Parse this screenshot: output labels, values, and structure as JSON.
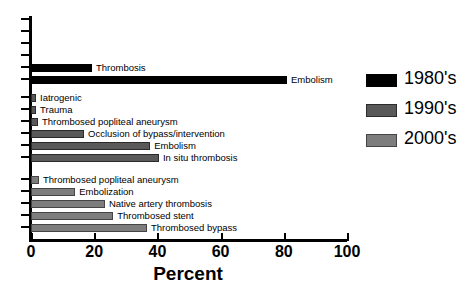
{
  "chart_data": {
    "type": "bar",
    "title": "",
    "xlabel": "Percent",
    "ylabel": "",
    "xlim": [
      0,
      100
    ],
    "xticks": [
      0,
      20,
      40,
      60,
      80,
      100
    ],
    "orientation": "horizontal",
    "grid": false,
    "legend_position": "right",
    "series": [
      {
        "name": "1980's",
        "color": "#000000",
        "categories": [
          "Thrombosis",
          "Embolism"
        ],
        "values": [
          19.3,
          81.0
        ]
      },
      {
        "name": "1990's",
        "color": "#595959",
        "categories": [
          "Iatrogenic",
          "Trauma",
          "Thrombosed popliteal aneurysm",
          "Occlusion of bypass/intervention",
          "Embolism",
          "In situ thrombosis"
        ],
        "values": [
          1.6,
          1.6,
          2.2,
          16.8,
          37.7,
          40.5
        ]
      },
      {
        "name": "2000's",
        "color": "#7d7d7d",
        "categories": [
          "Thrombosed popliteal aneurysm",
          "Embolization",
          "Native artery thrombosis",
          "Thrombosed stent",
          "Thrombosed bypass"
        ],
        "values": [
          2.5,
          14.0,
          23.4,
          26.0,
          36.7
        ]
      }
    ]
  },
  "axis": {
    "x_title": "Percent",
    "x_tick_labels": [
      "0",
      "20",
      "40",
      "60",
      "80",
      "100"
    ]
  },
  "bars": [
    {
      "label": "Thrombosis",
      "value": 19.3,
      "series": "1980's",
      "top": 64,
      "style": "c1980"
    },
    {
      "label": "Embolism",
      "value": 81.0,
      "series": "1980's",
      "top": 76,
      "style": "c1980"
    },
    {
      "label": "Iatrogenic",
      "value": 1.6,
      "series": "1990's",
      "top": 94,
      "style": "c1990"
    },
    {
      "label": "Trauma",
      "value": 1.6,
      "series": "1990's",
      "top": 106,
      "style": "c1990"
    },
    {
      "label": "Thrombosed popliteal aneurysm",
      "value": 2.2,
      "series": "1990's",
      "top": 118,
      "style": "c1990"
    },
    {
      "label": "Occlusion of bypass/intervention",
      "value": 16.8,
      "series": "1990's",
      "top": 130,
      "style": "c1990"
    },
    {
      "label": "Embolism",
      "value": 37.7,
      "series": "1990's",
      "top": 142,
      "style": "c1990"
    },
    {
      "label": "In situ thrombosis",
      "value": 40.5,
      "series": "1990's",
      "top": 154,
      "style": "c1990"
    },
    {
      "label": "Thrombosed popliteal aneurysm",
      "value": 2.5,
      "series": "2000's",
      "top": 176,
      "style": "c2000"
    },
    {
      "label": "Embolization",
      "value": 14.0,
      "series": "2000's",
      "top": 188,
      "style": "c2000"
    },
    {
      "label": "Native artery thrombosis",
      "value": 23.4,
      "series": "2000's",
      "top": 200,
      "style": "c2000"
    },
    {
      "label": "Thrombosed stent",
      "value": 26.0,
      "series": "2000's",
      "top": 212,
      "style": "c2000"
    },
    {
      "label": "Thrombosed bypass",
      "value": 36.7,
      "series": "2000's",
      "top": 224,
      "style": "c2000"
    }
  ],
  "y_tick_positions": [
    18,
    30,
    42,
    54,
    66,
    78,
    96,
    108,
    120,
    132,
    144,
    156,
    178,
    190,
    202,
    214,
    226
  ],
  "legend": {
    "items": [
      {
        "label": "1980's",
        "style": "c1980",
        "color": "#000000"
      },
      {
        "label": "1990's",
        "style": "c1990",
        "color": "#595959"
      },
      {
        "label": "2000's",
        "style": "c2000",
        "color": "#7d7d7d"
      }
    ]
  }
}
